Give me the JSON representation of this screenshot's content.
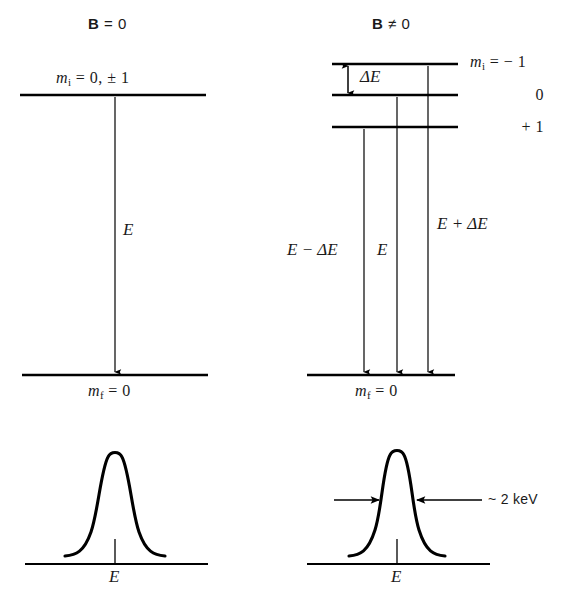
{
  "figure": {
    "type": "energy-level-diagram",
    "background_color": "#ffffff",
    "line_color": "#000000"
  },
  "panels": {
    "left": {
      "heading_symbol": "B",
      "heading_rest": "= 0",
      "heading_full": "B = 0",
      "upper_level_label": "m",
      "upper_level_sub": "i",
      "upper_level_value": "= 0, ± 1",
      "lower_level_label": "m",
      "lower_level_sub": "f",
      "lower_level_value": "= 0",
      "transition_label": "E",
      "spectrum_tick_label": "E"
    },
    "right": {
      "heading_symbol": "B",
      "heading_rest": "≠ 0",
      "heading_full": "B ≠ 0",
      "splitting_label": "ΔE",
      "level_labels": [
        {
          "label": "m",
          "sub": "i",
          "value": "=  − 1"
        },
        {
          "label": "",
          "sub": "",
          "value": "0"
        },
        {
          "label": "",
          "sub": "",
          "value": "+ 1"
        }
      ],
      "transition_labels": [
        "E  −  ΔE",
        "E",
        "E  +  ΔE"
      ],
      "lower_level_label": "m",
      "lower_level_sub": "f",
      "lower_level_value": "= 0",
      "width_annotation": "~ 2 keV",
      "spectrum_tick_label": "E"
    }
  }
}
